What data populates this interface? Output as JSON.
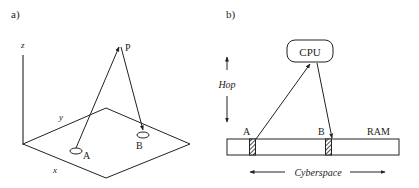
{
  "panel_a": {
    "label": "a)",
    "axes": {
      "z": "z",
      "y": "y",
      "x": "x"
    },
    "points": {
      "A": "A",
      "B": "B",
      "P": "P"
    }
  },
  "panel_b": {
    "label": "b)",
    "cpu": "CPU",
    "ram": "RAM",
    "points": {
      "A": "A",
      "B": "B"
    },
    "hop_label": "Hop",
    "cyberspace_label": "Cyberspace"
  },
  "colors": {
    "ink": "#222222",
    "background": "#ffffff"
  }
}
